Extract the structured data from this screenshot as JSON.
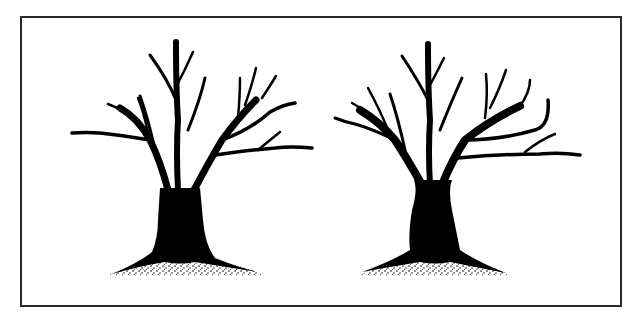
{
  "figure": {
    "panels": [
      {
        "id": "left",
        "subject": "tree-silhouette",
        "variant": "trunk with flat cut top, bare branches, stippled ground mound"
      },
      {
        "id": "right",
        "subject": "tree-silhouette",
        "variant": "forked trunk, bare branches, stippled ground mound"
      }
    ],
    "caption": ""
  },
  "colors": {
    "ink": "#000000",
    "frame": "#2a2a2a",
    "paper": "#ffffff"
  }
}
